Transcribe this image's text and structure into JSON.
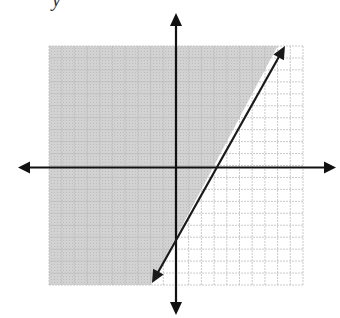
{
  "header": {
    "cropped_text": "y"
  },
  "chart_data": {
    "type": "line",
    "title": "",
    "xlabel": "",
    "ylabel": "",
    "xlim": [
      -10,
      10
    ],
    "ylim": [
      -10,
      10
    ],
    "grid": true,
    "grid_step": 1,
    "axes": {
      "x_arrows": true,
      "y_arrows": true
    },
    "series": [
      {
        "name": "boundary line",
        "equation": "y = 2x - 6",
        "slope": 2,
        "intercept": -6,
        "style": "solid",
        "arrows": "both",
        "x": [
          -2,
          8.5
        ],
        "y": [
          -10,
          11
        ]
      }
    ],
    "shading": {
      "region": "left/above the line",
      "inequality": "y > 2x - 6",
      "color": "#cdcdcd"
    },
    "colors": {
      "axis": "#111111",
      "line": "#1a1a1a",
      "grid_shaded": "#aaaaaa",
      "grid_unshaded": "#bdbdbd",
      "shade": "#cdcdcd"
    }
  }
}
